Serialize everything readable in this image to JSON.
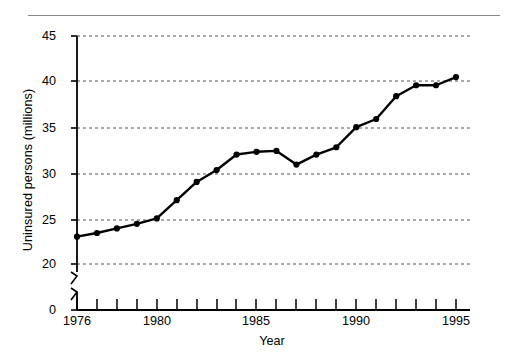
{
  "figure": {
    "background": "#ffffff",
    "ink": "#000000",
    "rule_color": "#8a8a8a",
    "grid_color": "#555555"
  },
  "chart_data": {
    "type": "line",
    "title": "",
    "subtitle": "",
    "xlabel": "Year",
    "ylabel": "Uninsured persons (millions)",
    "x": [
      1976,
      1977,
      1978,
      1979,
      1980,
      1981,
      1982,
      1983,
      1984,
      1985,
      1986,
      1987,
      1988,
      1989,
      1990,
      1991,
      1992,
      1993,
      1994,
      1995
    ],
    "values": [
      23.0,
      23.4,
      23.9,
      24.4,
      25.0,
      27.0,
      29.0,
      30.3,
      32.0,
      32.3,
      32.4,
      30.9,
      32.0,
      32.8,
      35.0,
      35.9,
      38.4,
      39.6,
      39.6,
      40.5
    ],
    "series": [
      {
        "name": "Uninsured persons",
        "values": [
          23.0,
          23.4,
          23.9,
          24.4,
          25.0,
          27.0,
          29.0,
          30.3,
          32.0,
          32.3,
          32.4,
          30.9,
          32.0,
          32.8,
          35.0,
          35.9,
          38.4,
          39.6,
          39.6,
          40.5
        ]
      }
    ],
    "xlim": [
      1975.5,
      1995.7
    ],
    "ylim": [
      20,
      45
    ],
    "y_axis_break": true,
    "y_axis_break_between": [
      0,
      20
    ],
    "ytick_labels": [
      "45",
      "40",
      "35",
      "30",
      "25",
      "20",
      "0"
    ],
    "ytick_values": [
      45,
      40,
      35,
      30,
      25,
      20,
      0
    ],
    "xtick_labels": [
      "1976",
      "1980",
      "1985",
      "1990",
      "1995"
    ],
    "xtick_values": [
      1976,
      1980,
      1985,
      1990,
      1995
    ],
    "xtick_minor_every": 1,
    "grid": "horizontal-dashed",
    "gridlines_at": [
      45,
      40,
      35,
      30,
      25,
      20
    ],
    "legend": null,
    "legend_position": "none",
    "marker": "filled-circle",
    "line_width": 2.4,
    "marker_size": 5,
    "line_color": "#000000",
    "marker_color": "#000000",
    "annotations": []
  }
}
